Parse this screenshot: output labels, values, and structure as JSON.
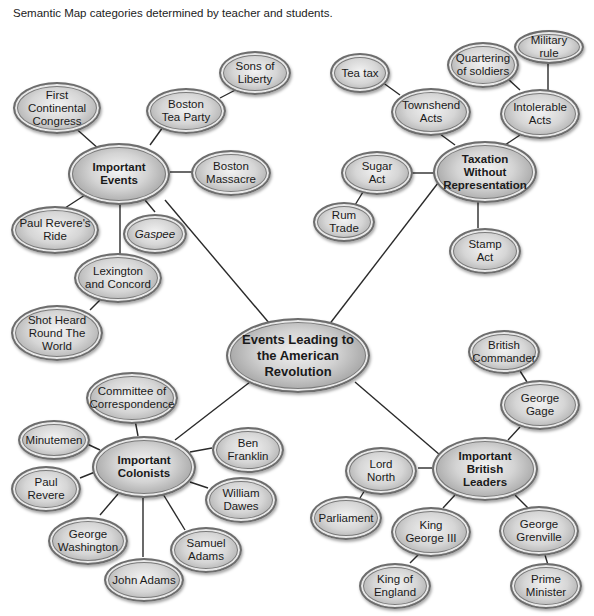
{
  "caption": "Semantic Map categories determined by teacher and students.",
  "center": {
    "label": "Events Leading to\nthe American\nRevolution"
  },
  "hubs": {
    "events": "Important\nEvents",
    "taxation": "Taxation\nWithout\nRepresentation",
    "colonists": "Important\nColonists",
    "british": "Important\nBritish\nLeaders"
  },
  "events": {
    "first_congress": "First\nContinental\nCongress",
    "tea_party": "Boston\nTea Party",
    "sons_liberty": "Sons of\nLiberty",
    "massacre": "Boston\nMassacre",
    "revere_ride": "Paul Revere's\nRide",
    "gaspee": "Gaspee",
    "lexington": "Lexington\nand Concord",
    "shot_heard": "Shot Heard\nRound The\nWorld"
  },
  "taxation": {
    "tea_tax": "Tea tax",
    "townshend": "Townshend\nActs",
    "quartering": "Quartering\nof soldiers",
    "military_rule": "Military\nrule",
    "intolerable": "Intolerable\nActs",
    "sugar": "Sugar\nAct",
    "rum": "Rum\nTrade",
    "stamp": "Stamp\nAct"
  },
  "colonists": {
    "committee": "Committee of\nCorrespondence",
    "minutemen": "Minutemen",
    "franklin": "Ben\nFranklin",
    "revere": "Paul\nRevere",
    "dawes": "William\nDawes",
    "washington": "George\nWashington",
    "samuel_adams": "Samuel\nAdams",
    "john_adams": "John Adams"
  },
  "british": {
    "commander": "British\nCommander",
    "gage": "George\nGage",
    "north": "Lord\nNorth",
    "parliament": "Parliament",
    "george3": "King\nGeorge III",
    "king_england": "King of\nEngland",
    "grenville": "George\nGrenville",
    "prime_minister": "Prime\nMinister"
  }
}
